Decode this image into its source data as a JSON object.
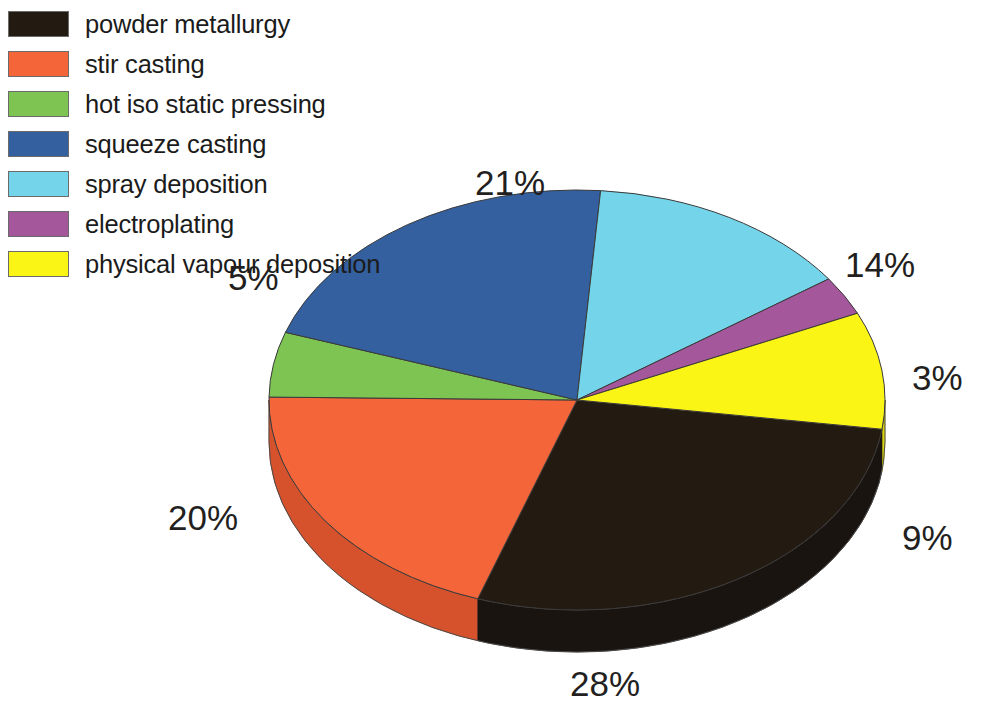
{
  "legend": {
    "items": [
      {
        "label": "powder metallurgy",
        "color": "#231a12"
      },
      {
        "label": "stir casting",
        "color": "#f4663a"
      },
      {
        "label": "hot iso static pressing",
        "color": "#7dc452"
      },
      {
        "label": "squeeze casting",
        "color": "#34609f"
      },
      {
        "label": "spray deposition",
        "color": "#74d4ea"
      },
      {
        "label": "electroplating",
        "color": "#a5579c"
      },
      {
        "label": "physical vapour deposition",
        "color": "#fbf516"
      }
    ]
  },
  "labels": {
    "p28": "28%",
    "p20": "20%",
    "p5": "5%",
    "p21": "21%",
    "p14": "14%",
    "p3": "3%",
    "p9": "9%"
  },
  "chart_data": {
    "type": "pie",
    "title": "",
    "subtitle": "",
    "xlabel": "",
    "ylabel": "",
    "three_d": true,
    "legend_position": "top-left",
    "grid": false,
    "units": "percent",
    "total": 100,
    "categories": [
      "powder metallurgy",
      "stir casting",
      "hot iso static pressing",
      "squeeze casting",
      "spray deposition",
      "electroplating",
      "physical vapour deposition"
    ],
    "values": [
      28,
      20,
      5,
      21,
      14,
      3,
      9
    ],
    "data_labels": [
      "28%",
      "20%",
      "5%",
      "21%",
      "14%",
      "3%",
      "9%"
    ],
    "colors": [
      "#231a12",
      "#f4663a",
      "#7dc452",
      "#34609f",
      "#74d4ea",
      "#a5579c",
      "#fbf516"
    ],
    "slices": [
      {
        "name": "powder metallurgy",
        "value": 28,
        "label": "28%",
        "color": "#231a12",
        "side_color": "#1a1410"
      },
      {
        "name": "stir casting",
        "value": 20,
        "label": "20%",
        "color": "#f4663a",
        "side_color": "#d5522c"
      },
      {
        "name": "hot iso static pressing",
        "value": 5,
        "label": "5%",
        "color": "#7dc452",
        "side_color": "#63a63d"
      },
      {
        "name": "squeeze casting",
        "value": 21,
        "label": "21%",
        "color": "#34609f",
        "side_color": "#274b7e"
      },
      {
        "name": "spray deposition",
        "value": 14,
        "label": "14%",
        "color": "#74d4ea",
        "side_color": "#52b4cc"
      },
      {
        "name": "electroplating",
        "value": 3,
        "label": "3%",
        "color": "#a5579c",
        "side_color": "#85417c"
      },
      {
        "name": "physical vapour deposition",
        "value": 9,
        "label": "9%",
        "color": "#fbf516",
        "side_color": "#d8d210"
      }
    ]
  }
}
